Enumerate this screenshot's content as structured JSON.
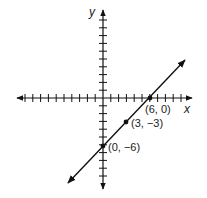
{
  "chart_data": {
    "type": "line",
    "title": "",
    "xlabel": "x",
    "ylabel": "y",
    "xlim": [
      -12,
      12
    ],
    "ylim": [
      -12,
      12
    ],
    "grid": false,
    "tick_spacing": 1,
    "series": [
      {
        "name": "line",
        "x": [
          -4.5,
          10.5
        ],
        "y": [
          -10.5,
          4.5
        ],
        "arrows": "both"
      }
    ],
    "points": [
      {
        "x": 6,
        "y": 0,
        "label": "(6, 0)"
      },
      {
        "x": 3,
        "y": -3,
        "label": "(3, −3)"
      },
      {
        "x": 0,
        "y": -6,
        "label": "(0, −6)"
      }
    ]
  },
  "labels": {
    "x_axis": "x",
    "y_axis": "y",
    "p1": "(6, 0)",
    "p2": "(3, −3)",
    "p3": "(0, −6)"
  }
}
